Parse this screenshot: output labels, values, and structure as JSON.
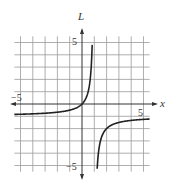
{
  "chart_data": {
    "type": "line",
    "title": "",
    "xlabel": "x",
    "ylabel": "L",
    "xlim": [
      -5.5,
      5.5
    ],
    "ylim": [
      -5.5,
      5.5
    ],
    "grid": true,
    "x_ticks_labeled": [
      {
        "value": -5,
        "label": "−5"
      },
      {
        "value": 5,
        "label": "5"
      }
    ],
    "y_ticks_labeled": [
      {
        "value": 5,
        "label": "5"
      },
      {
        "value": -5,
        "label": "−5"
      }
    ],
    "vertical_asymptote": 1,
    "horizontal_asymptote": -1,
    "function": "L = -1 + 1/(1 - x)",
    "series": [
      {
        "name": "left-branch",
        "points": [
          [
            -5.5,
            -0.846
          ],
          [
            -5,
            -0.833
          ],
          [
            -4,
            -0.8
          ],
          [
            -3,
            -0.75
          ],
          [
            -2,
            -0.667
          ],
          [
            -1,
            -0.5
          ],
          [
            0,
            0
          ],
          [
            0.5,
            1
          ],
          [
            0.7,
            2.33
          ],
          [
            0.8,
            4
          ],
          [
            0.85,
            5.67
          ]
        ]
      },
      {
        "name": "right-branch",
        "points": [
          [
            1.15,
            -7.67
          ],
          [
            1.2,
            -6
          ],
          [
            1.3,
            -4.33
          ],
          [
            1.5,
            -3
          ],
          [
            2,
            -2
          ],
          [
            3,
            -1.5
          ],
          [
            4,
            -1.33
          ],
          [
            5,
            -1.25
          ],
          [
            5.5,
            -1.22
          ]
        ]
      }
    ],
    "colors": {
      "grid": "#9a9a9a",
      "axis": "#333333",
      "curve": "#222222"
    }
  },
  "labels": {
    "x_axis": "x",
    "y_axis": "L",
    "x_neg5": "−5",
    "x_pos5": "5",
    "y_pos5": "5",
    "y_neg5": "−5"
  }
}
